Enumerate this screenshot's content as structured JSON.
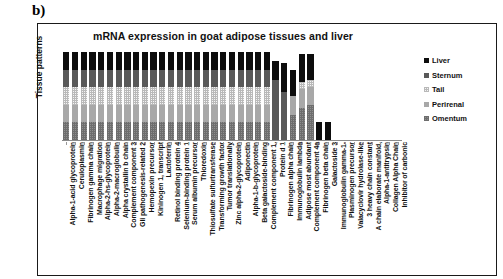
{
  "panel_label": "b)",
  "chart_title": "mRNA expression in goat adipose tissues and liver",
  "yaxis_title": "Tissue patterns",
  "legend": {
    "items": [
      {
        "label": "Liver",
        "color": "#0d0d0d",
        "swatch_icon": "legend-square-icon"
      },
      {
        "label": "Sternum",
        "color": "#595959",
        "swatch_icon": "legend-square-icon"
      },
      {
        "label": "Tail",
        "color": "#f4f4f4",
        "swatch_icon": "legend-square-icon"
      },
      {
        "label": "Perirenal",
        "color": "#a8a8a8",
        "swatch_icon": "legend-square-icon"
      },
      {
        "label": "Omentum",
        "color": "#8f8f8f",
        "swatch_icon": "legend-square-icon"
      }
    ]
  },
  "chart_data": {
    "type": "bar",
    "title": "mRNA expression in goat adipose tissues and liver",
    "xlabel": "",
    "ylabel": "Tissue patterns",
    "stacked": true,
    "normalized": true,
    "grid": false,
    "legend_position": "right",
    "ylim": [
      0,
      100
    ],
    "categories": [
      "Alpha-1-acid glycoprotein",
      "Ceruloplasmin",
      "Fibrinogen gamma chain",
      "Macrophage migration",
      "Alpha-2-hs-glycoprotein",
      "Alpha-2-macroglobulin",
      "Alpha crystallin b chain",
      "Complement component 3",
      "Gli pathogenesis-related 2",
      "Hemopexin precursor",
      "Kininogen 1, transcript",
      "Lactoferrin",
      "Retinol binding protein 4",
      "Selenium-binding protein 1",
      "Serum albumin precursor",
      "Thioredoxin",
      "Thiosulfate sulfurtransferase",
      "Transforming growth factor",
      "Tumor translationally",
      "Zinc alpha-2-glycoprotein",
      "Adiponectin",
      "Alpha-1-b-glycoprotein",
      "Beta galactoside-binding",
      "Complement component 1,",
      "Protein d 1",
      "Fibrinogen alpha chain",
      "Immunoglobulin lambda",
      "Adipose most abundant",
      "Complement component 4a",
      "Fibrinogen beta chain",
      "Galactoside 3",
      "Immunoglobulin gamma-1-",
      "Plasminogen precursor",
      "Valacyclovir hydrolase-like",
      "3 heavy chain constant",
      "A chain elaborate manifold,",
      "Alpha-1-antitrypsin",
      "Collagen Alpha Chain",
      "Inhibitor of carbonic"
    ],
    "series": [
      {
        "name": "Omentum",
        "color": "#8f8f8f",
        "values": [
          20,
          20,
          20,
          20,
          20,
          20,
          20,
          20,
          20,
          20,
          20,
          20,
          20,
          20,
          20,
          20,
          20,
          20,
          20,
          20,
          20,
          20,
          20,
          20,
          0,
          0,
          28,
          36,
          40,
          0,
          0,
          0,
          0,
          0,
          0,
          0,
          0,
          0,
          0
        ]
      },
      {
        "name": "Perirenal",
        "color": "#a8a8a8",
        "values": [
          20,
          20,
          20,
          20,
          20,
          20,
          20,
          20,
          20,
          20,
          20,
          20,
          20,
          20,
          20,
          20,
          20,
          20,
          20,
          20,
          20,
          20,
          20,
          20,
          0,
          0,
          22,
          22,
          20,
          0,
          0,
          0,
          0,
          0,
          0,
          0,
          0,
          0,
          0
        ]
      },
      {
        "name": "Tail",
        "color": "#f4f4f4",
        "values": [
          20,
          20,
          20,
          20,
          20,
          20,
          20,
          20,
          20,
          20,
          20,
          20,
          20,
          20,
          20,
          20,
          20,
          20,
          20,
          20,
          20,
          20,
          20,
          20,
          0,
          0,
          0,
          8,
          8,
          0,
          0,
          0,
          0,
          0,
          0,
          0,
          0,
          0,
          0
        ]
      },
      {
        "name": "Sternum",
        "color": "#595959",
        "values": [
          20,
          20,
          20,
          20,
          20,
          20,
          20,
          20,
          20,
          20,
          20,
          20,
          20,
          20,
          20,
          20,
          20,
          20,
          20,
          20,
          20,
          20,
          20,
          20,
          68,
          55,
          0,
          0,
          0,
          0,
          0,
          0,
          0,
          0,
          0,
          0,
          0,
          0,
          0
        ]
      },
      {
        "name": "Liver",
        "color": "#0d0d0d",
        "values": [
          20,
          20,
          20,
          20,
          20,
          20,
          20,
          20,
          20,
          20,
          20,
          20,
          20,
          20,
          20,
          20,
          20,
          20,
          20,
          20,
          20,
          20,
          20,
          20,
          22,
          32,
          30,
          32,
          30,
          20,
          20,
          0,
          0,
          0,
          0,
          0,
          0,
          0,
          0
        ]
      }
    ]
  }
}
